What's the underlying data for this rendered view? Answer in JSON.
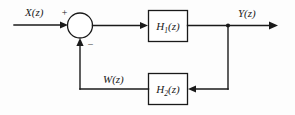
{
  "diagram": {
    "type": "control-system-block-diagram",
    "background_color": "#fdfdfd",
    "line_color": "#1a1a1a",
    "signals": {
      "input_label": "X(z)",
      "output_label": "Y(z)",
      "feedback_label": "W(z)"
    },
    "blocks": {
      "forward": {
        "name": "H",
        "subscript": "1",
        "argument": "(z)",
        "full_label": "H1(z)"
      },
      "feedback": {
        "name": "H",
        "subscript": "2",
        "argument": "(z)",
        "full_label": "H2(z)"
      }
    },
    "summing_junction": {
      "plus_sign": "+",
      "minus_sign": "−"
    }
  }
}
